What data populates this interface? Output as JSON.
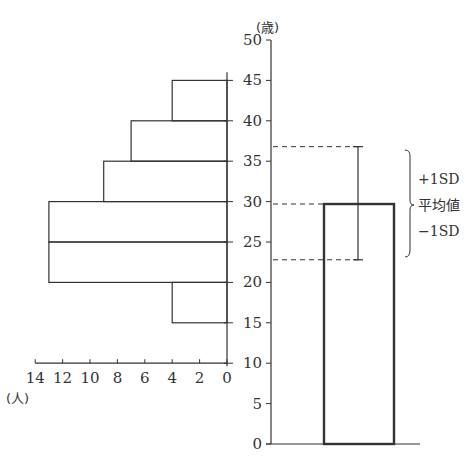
{
  "chart_data": [
    {
      "type": "bar",
      "orientation": "horizontal",
      "title": "",
      "description": "Age distribution histogram (number of people per 5-year age class)",
      "categories": [
        "15-20",
        "20-25",
        "25-30",
        "30-35",
        "35-40",
        "40-45"
      ],
      "values": [
        4,
        13,
        13,
        9,
        7,
        4
      ],
      "xlabel": "(人)",
      "ylabel": "(歳)",
      "xlim": [
        14,
        0
      ],
      "x_ticks": [
        "14",
        "12",
        "10",
        "8",
        "6",
        "4",
        "2",
        "0"
      ],
      "ylim": [
        10,
        45
      ],
      "grid": false
    },
    {
      "type": "bar",
      "title": "",
      "description": "Mean age with ±1 standard deviation error bar",
      "categories": [
        "mean"
      ],
      "values": [
        29.7
      ],
      "error": {
        "plus_1sd": 36.8,
        "minus_1sd": 22.8
      },
      "ylabel": "(歳)",
      "ylim": [
        0,
        50
      ],
      "y_ticks": [
        "0",
        "5",
        "10",
        "15",
        "20",
        "25",
        "30",
        "35",
        "40",
        "45",
        "50"
      ],
      "annotations": [
        "+1SD",
        "平均値",
        "−1SD"
      ],
      "grid": false
    }
  ],
  "labels": {
    "y_unit": "(歳)",
    "x_unit": "(人)",
    "plus_sd": "+1SD",
    "mean": "平均値",
    "minus_sd": "−1SD"
  },
  "colors": {
    "line": "#333333",
    "background": "#ffffff"
  }
}
